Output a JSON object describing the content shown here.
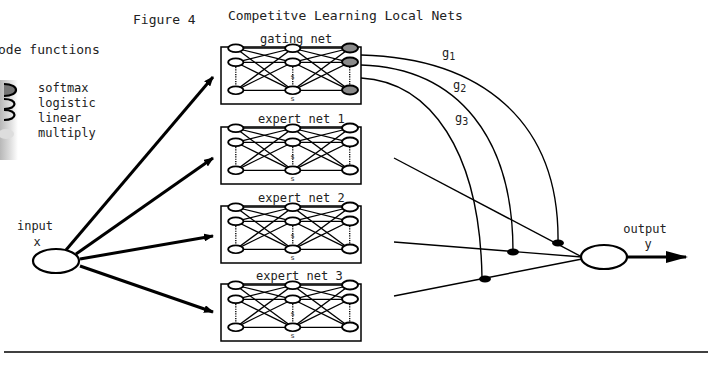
{
  "figure": {
    "label": "Figure 4",
    "title": "Competitve Learning Local Nets"
  },
  "legend": {
    "title": "ode functions",
    "items": [
      {
        "label": "softmax",
        "icon": "filled-ellipse-node"
      },
      {
        "label": "logistic",
        "icon": "ellipse-node"
      },
      {
        "label": "linear",
        "icon": "ellipse-node"
      },
      {
        "label": "multiply",
        "icon": "small-filled-node"
      }
    ]
  },
  "networks": [
    {
      "label": "gating net",
      "role": "gating"
    },
    {
      "label": "expert net 1",
      "role": "expert"
    },
    {
      "label": "expert net 2",
      "role": "expert"
    },
    {
      "label": "expert net 3",
      "role": "expert"
    }
  ],
  "gates": [
    "g1",
    "g2",
    "g3"
  ],
  "gate_labels": {
    "g1_base": "g",
    "g1_sub": "1",
    "g2_base": "g",
    "g2_sub": "2",
    "g3_base": "g",
    "g3_sub": "3"
  },
  "input": {
    "label": "input",
    "var": "x"
  },
  "output": {
    "label": "output",
    "var": "y"
  },
  "colors": {
    "line": "#000000",
    "softmax_fill": "#8a8a8a",
    "background": "#ffffff"
  }
}
